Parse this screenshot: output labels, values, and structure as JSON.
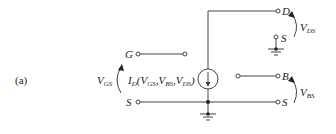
{
  "figure": {
    "panel_label": "(a)",
    "terminals": {
      "gate": "G",
      "source_left": "S",
      "drain": "D",
      "source_drain_ref": "S",
      "body": "B",
      "source_right": "S"
    },
    "voltages": {
      "vgs": {
        "main": "V",
        "sub": "GS"
      },
      "vds": {
        "main": "V",
        "sub": "DS"
      },
      "vbs": {
        "main": "V",
        "sub": "BS"
      }
    },
    "current_source": {
      "label_main": "I",
      "label_sub": "D",
      "args": [
        {
          "main": "V",
          "sub": "GS"
        },
        {
          "main": "V",
          "sub": "BS"
        },
        {
          "main": "V",
          "sub": "DS"
        }
      ]
    },
    "colors": {
      "line": "#444444",
      "text": "#222222"
    }
  }
}
